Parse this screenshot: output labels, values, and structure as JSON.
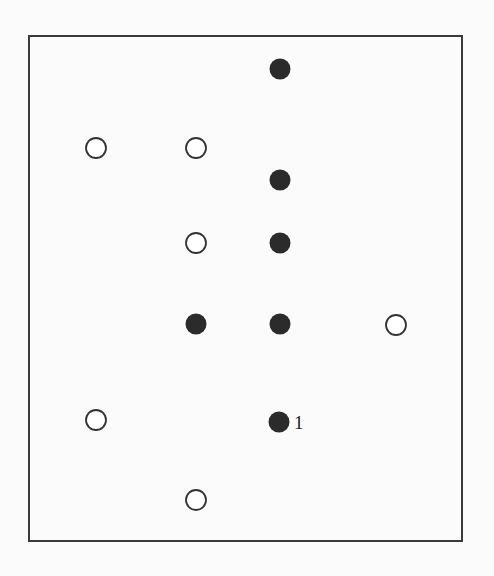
{
  "diagram": {
    "frame": {
      "x": 29,
      "y": 36,
      "width": 433,
      "height": 505,
      "stroke": "#3a3a3a"
    },
    "marker_radius": 10,
    "colors": {
      "filled": "#2b2b2b",
      "open_stroke": "#333333",
      "open_fill": "#ffffff"
    },
    "points": [
      {
        "x": 280,
        "y": 69,
        "type": "filled",
        "label": ""
      },
      {
        "x": 96,
        "y": 148,
        "type": "open",
        "label": ""
      },
      {
        "x": 196,
        "y": 148,
        "type": "open",
        "label": ""
      },
      {
        "x": 280,
        "y": 180,
        "type": "filled",
        "label": ""
      },
      {
        "x": 196,
        "y": 243,
        "type": "open",
        "label": ""
      },
      {
        "x": 280,
        "y": 243,
        "type": "filled",
        "label": ""
      },
      {
        "x": 196,
        "y": 324,
        "type": "filled",
        "label": ""
      },
      {
        "x": 280,
        "y": 324,
        "type": "filled",
        "label": ""
      },
      {
        "x": 396,
        "y": 325,
        "type": "open",
        "label": ""
      },
      {
        "x": 96,
        "y": 420,
        "type": "open",
        "label": ""
      },
      {
        "x": 279,
        "y": 422,
        "type": "filled",
        "label": "1"
      },
      {
        "x": 196,
        "y": 500,
        "type": "open",
        "label": ""
      }
    ]
  }
}
